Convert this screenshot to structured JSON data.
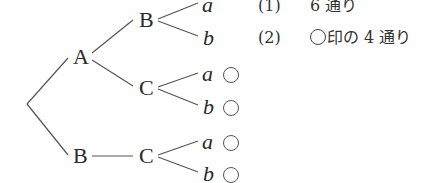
{
  "tree": {
    "root_children": [
      "A",
      "B"
    ],
    "nodes": {
      "A": "A",
      "B_top": "B",
      "C_mid": "C",
      "B_bottom": "B",
      "C_bottom": "C"
    },
    "leaves": [
      {
        "label": "a",
        "marked": false
      },
      {
        "label": "b",
        "marked": false
      },
      {
        "label": "a",
        "marked": true
      },
      {
        "label": "b",
        "marked": true
      },
      {
        "label": "a",
        "marked": true
      },
      {
        "label": "b",
        "marked": true
      }
    ],
    "mark_symbol": "○"
  },
  "answers": [
    {
      "number": "(1)",
      "text": "6 通り"
    },
    {
      "number": "(2)",
      "prefix_mark": "○",
      "text": "印の 4 通り"
    }
  ]
}
